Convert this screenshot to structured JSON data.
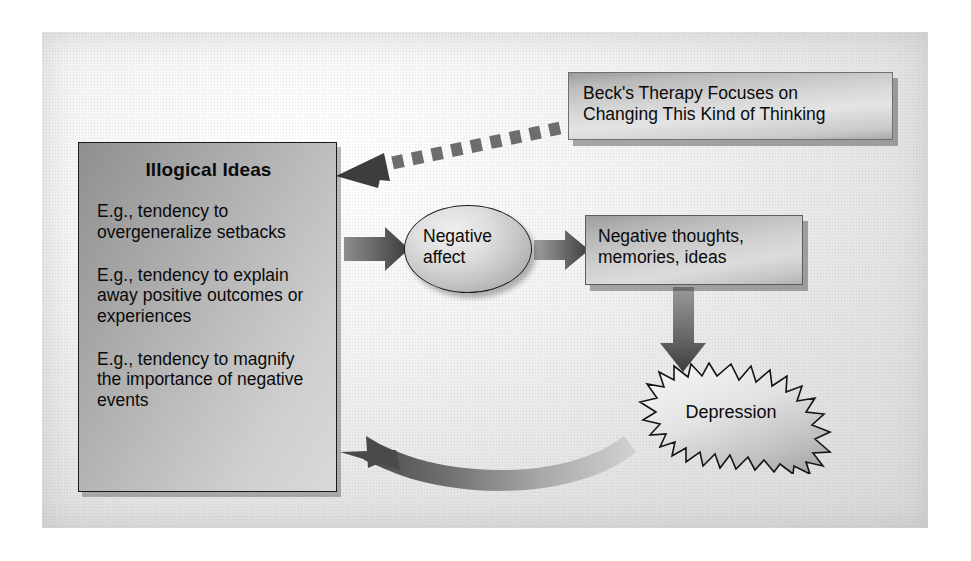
{
  "diagram": {
    "palette": {
      "box_fill_dark": "#8f8f8f",
      "box_fill_light": "#d9d9d9",
      "outline": "#1b1b1b",
      "arrow_dark": "#4a4a4a",
      "arrow_light": "#c8c8c8",
      "panel_bg": "#e6e6e6",
      "text": "#0a0a0a"
    },
    "nodes": {
      "illogical": {
        "title": "Illogical Ideas",
        "items": [
          "E.g., tendency to overgeneralize setbacks",
          "E.g., tendency to explain away positive outcomes or experiences",
          "E.g., tendency to magnify the importance of negative events"
        ]
      },
      "beck": {
        "line1": "Beck's Therapy Focuses on",
        "line2": "Changing This Kind of Thinking"
      },
      "affect": {
        "line1": "Negative",
        "line2": "affect"
      },
      "thoughts": {
        "line1": "Negative thoughts,",
        "line2": "memories, ideas"
      },
      "depression": {
        "label": "Depression"
      }
    },
    "edges": [
      {
        "id": "illogical-to-affect",
        "from": "Illogical Ideas",
        "to": "Negative affect",
        "style": "solid-block-arrow",
        "direction": "right"
      },
      {
        "id": "affect-to-thoughts",
        "from": "Negative affect",
        "to": "Negative thoughts, memories, ideas",
        "style": "solid-block-arrow",
        "direction": "right"
      },
      {
        "id": "thoughts-to-depression",
        "from": "Negative thoughts, memories, ideas",
        "to": "Depression",
        "style": "solid-block-arrow",
        "direction": "down"
      },
      {
        "id": "depression-to-illogical",
        "from": "Depression",
        "to": "Illogical Ideas",
        "style": "curved-gradient-arrow",
        "direction": "left"
      },
      {
        "id": "beck-to-illogical",
        "from": "Beck's Therapy Focuses on Changing This Kind of Thinking",
        "to": "Illogical Ideas",
        "style": "dashed-arrow",
        "direction": "left"
      }
    ]
  }
}
